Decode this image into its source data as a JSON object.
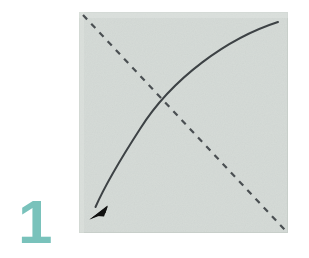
{
  "figure": {
    "kind": "origami-instruction-diagram",
    "width": 309,
    "height": 258,
    "background_color": "#ffffff"
  },
  "step": {
    "number": "1",
    "number_color": "#79c2bb",
    "position": {
      "x": 14,
      "y": 185
    }
  },
  "paper": {
    "label": "square-sheet",
    "fill_color": "#d4dad6",
    "edge_color": "#c8cfca",
    "x": 79,
    "y": 12,
    "width": 209,
    "height": 221
  },
  "fold_line": {
    "label": "valley-fold-crease",
    "style": "dashed",
    "color": "#4a4f52",
    "stroke_width": 2.2,
    "dash": "6 6",
    "from": {
      "x": 83,
      "y": 15
    },
    "to": {
      "x": 285,
      "y": 230
    }
  },
  "fold_arrow": {
    "label": "fold-direction-arrow",
    "style": "solid-curved",
    "color": "#3d4245",
    "stroke_width": 2.0,
    "from": {
      "x": 278,
      "y": 22
    },
    "control": {
      "x": 150,
      "y": 70
    },
    "to": {
      "x": 96,
      "y": 206
    },
    "arrowhead": {
      "tip": {
        "x": 89,
        "y": 219
      },
      "color": "#111111"
    }
  },
  "caption": {
    "alt_text": "Step 1: fold the square sheet along the diagonal crease from the top-right corner down to the bottom-left corner."
  }
}
